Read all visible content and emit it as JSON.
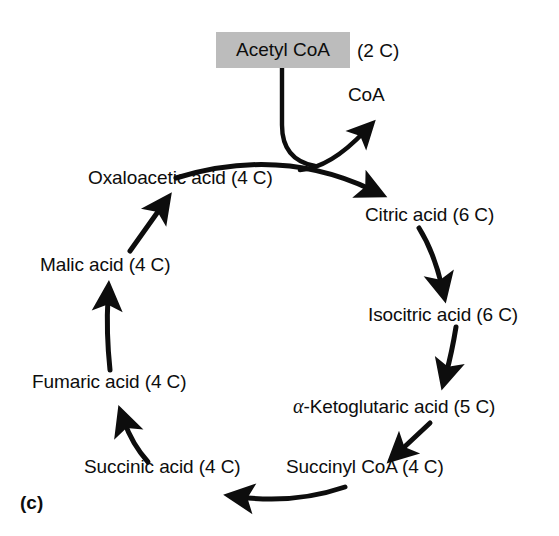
{
  "figure": {
    "panel_letter": "(c)",
    "title_semantic": "krebs-citric-acid-cycle",
    "background_color": "#ffffff",
    "ink_color": "#0d0d0d",
    "highlight_box_color": "#bcbcbc"
  },
  "input": {
    "label": "Acetyl CoA",
    "carbon_count": "(2 C)",
    "boxed": true
  },
  "byproduct": {
    "label": "CoA"
  },
  "nodes": [
    {
      "id": "citric",
      "label": "Citric acid (6 C)",
      "name": "Citric acid",
      "carbons": "6 C"
    },
    {
      "id": "isocitric",
      "label": "Isocitric acid (6 C)",
      "name": "Isocitric acid",
      "carbons": "6 C"
    },
    {
      "id": "ketoglu",
      "label": "-Ketoglutaric acid (5 C)",
      "prefix": "α",
      "name": "alpha-Ketoglutaric acid",
      "carbons": "5 C"
    },
    {
      "id": "succinyl",
      "label": "Succinyl CoA (4 C)",
      "name": "Succinyl CoA",
      "carbons": "4 C"
    },
    {
      "id": "succinic",
      "label": "Succinic acid (4 C)",
      "name": "Succinic acid",
      "carbons": "4 C"
    },
    {
      "id": "fumaric",
      "label": "Fumaric acid (4 C)",
      "name": "Fumaric acid",
      "carbons": "4 C"
    },
    {
      "id": "malic",
      "label": "Malic acid (4 C)",
      "name": "Malic acid",
      "carbons": "4 C"
    },
    {
      "id": "oxalo",
      "label": "Oxaloacetic acid (4 C)",
      "name": "Oxaloacetic acid",
      "carbons": "4 C"
    }
  ],
  "arrows": [
    {
      "from": "acetyl-coa",
      "to": "cycle-junction",
      "style": "curve"
    },
    {
      "from": "cycle-junction",
      "to": "coa",
      "style": "curve-arrow"
    },
    {
      "from": "oxalo",
      "to": "citric",
      "style": "arc-arrow"
    },
    {
      "from": "citric",
      "to": "isocitric",
      "style": "curve-arrow"
    },
    {
      "from": "isocitric",
      "to": "ketoglu",
      "style": "curve-arrow"
    },
    {
      "from": "ketoglu",
      "to": "succinyl",
      "style": "straight-arrow"
    },
    {
      "from": "succinyl",
      "to": "succinic",
      "style": "arc-arrow"
    },
    {
      "from": "succinic",
      "to": "fumaric",
      "style": "curve-arrow"
    },
    {
      "from": "fumaric",
      "to": "malic",
      "style": "straight-arrow"
    },
    {
      "from": "malic",
      "to": "oxalo",
      "style": "straight-arrow"
    }
  ]
}
